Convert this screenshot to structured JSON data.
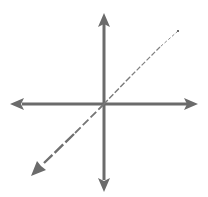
{
  "diagram": {
    "type": "3d-coordinate-axes",
    "colors": {
      "background": "#ffffff",
      "axis": "#6b6b6b",
      "depth_axis": "#7a7a7a"
    },
    "origin": [
      104,
      104
    ],
    "axes": [
      {
        "name": "horizontal-axis",
        "from": [
          11,
          104
        ],
        "to": [
          198,
          104
        ],
        "arrows": "both",
        "style": "solid"
      },
      {
        "name": "vertical-axis",
        "from": [
          104,
          13
        ],
        "to": [
          104,
          191
        ],
        "arrows": "both",
        "style": "solid"
      },
      {
        "name": "depth-axis",
        "from": [
          178,
          31
        ],
        "to": [
          32,
          175
        ],
        "arrows": "end",
        "style": "dashed-perspective"
      }
    ],
    "labels": []
  }
}
